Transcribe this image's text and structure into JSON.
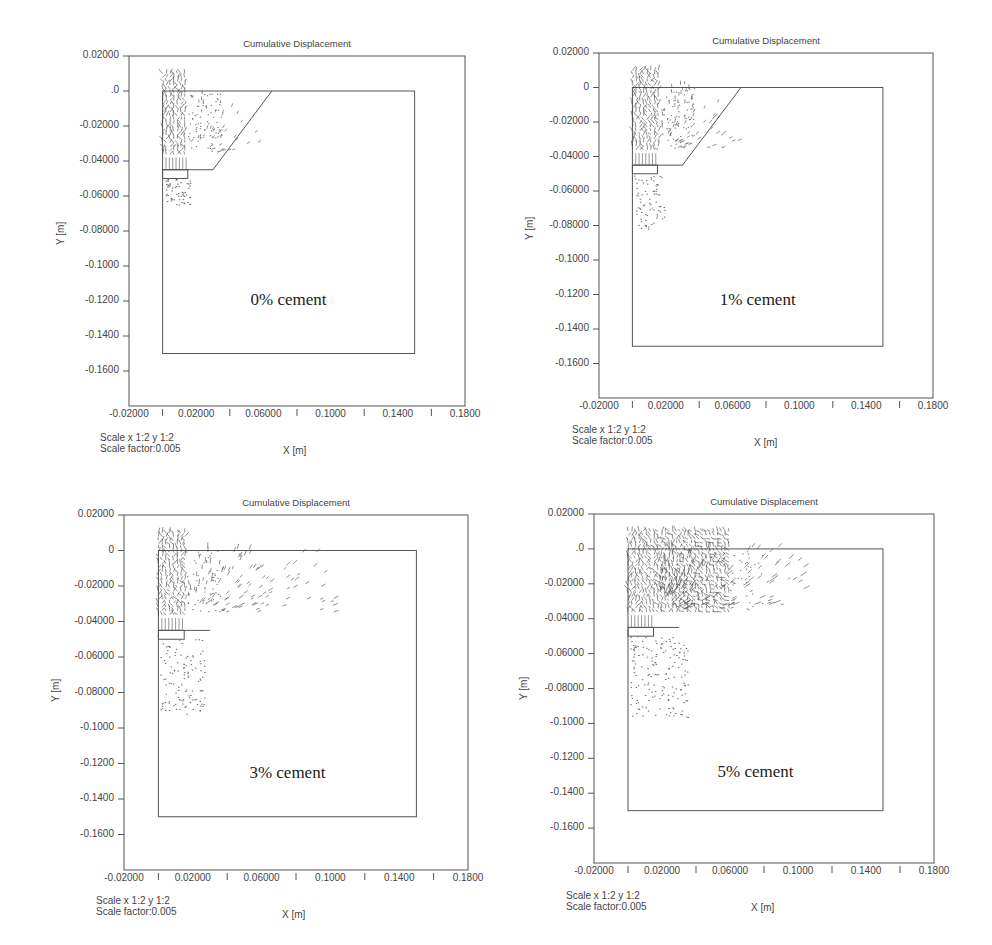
{
  "chart_data": [
    {
      "type": "vector-field",
      "title": "Cumulative Displacement",
      "annotation": "0% cement",
      "xlabel": "X [m]",
      "ylabel": "Y [m]",
      "scale_text": [
        "Scale x 1:2  y 1:2",
        "Scale factor:0.005"
      ],
      "xlim": [
        -0.02,
        0.18
      ],
      "ylim": [
        -0.18,
        0.02
      ],
      "x_ticks": [
        "-0.02000",
        "0.02000",
        "0.06000",
        "0.1000",
        "0.1400",
        "0.1800"
      ],
      "y_ticks": [
        "0.02000",
        ".0",
        "-0.02000",
        "-0.04000",
        "-0.06000",
        "-0.08000",
        "-0.1000",
        "-0.1200",
        "-0.1400",
        "-0.1600"
      ],
      "domain_box": {
        "x": [
          0.0,
          0.15
        ],
        "y": [
          -0.15,
          0.0
        ]
      },
      "slope_line": [
        [
          0.0,
          -0.045
        ],
        [
          0.03,
          -0.045
        ],
        [
          0.065,
          0.0
        ]
      ],
      "footing_box": {
        "x": [
          0.0,
          0.015
        ],
        "y": [
          -0.05,
          -0.045
        ]
      },
      "dense_zone": {
        "x": [
          0.0,
          0.015
        ],
        "y": [
          -0.038,
          0.01
        ]
      },
      "spread_extent": {
        "x": 0.04,
        "y": -0.065
      },
      "intensity": 0.15
    },
    {
      "type": "vector-field",
      "title": "Cumulative Displacement",
      "annotation": "1% cement",
      "xlabel": "X [m]",
      "ylabel": "Y [m]",
      "scale_text": [
        "Scale x 1:2  y 1:2",
        "Scale factor:0.005"
      ],
      "xlim": [
        -0.02,
        0.18
      ],
      "ylim": [
        -0.18,
        0.02
      ],
      "x_ticks": [
        "-0.02000",
        "0.02000",
        "0.06000",
        "0.1000",
        "0.1400",
        "0.1800"
      ],
      "y_ticks": [
        "0.02000",
        "0",
        "-0.02000",
        "-0.04000",
        "-0.06000",
        "-0.08000",
        "-0.1000",
        "-0.1200",
        "-0.1400",
        "-0.1600"
      ],
      "domain_box": {
        "x": [
          0.0,
          0.15
        ],
        "y": [
          -0.15,
          0.0
        ]
      },
      "slope_line": [
        [
          0.0,
          -0.045
        ],
        [
          0.03,
          -0.045
        ],
        [
          0.065,
          0.0
        ]
      ],
      "footing_box": {
        "x": [
          0.0,
          0.015
        ],
        "y": [
          -0.05,
          -0.045
        ]
      },
      "dense_zone": {
        "x": [
          0.0,
          0.017
        ],
        "y": [
          -0.038,
          0.01
        ]
      },
      "spread_extent": {
        "x": 0.045,
        "y": -0.082
      },
      "intensity": 0.25
    },
    {
      "type": "vector-field",
      "title": "Cumulative Displacement",
      "annotation": "3% cement",
      "xlabel": "X [m]",
      "ylabel": "Y [m]",
      "scale_text": [
        "Scale x 1:2  y 1:2",
        "Scale factor:0.005"
      ],
      "xlim": [
        -0.02,
        0.18
      ],
      "ylim": [
        -0.18,
        0.02
      ],
      "x_ticks": [
        "-0.02000",
        "0.02000",
        "0.06000",
        "0.1000",
        "0.1400",
        "0.1800"
      ],
      "y_ticks": [
        "0.02000",
        "0",
        "-0.02000",
        "-0.04000",
        "-0.06000",
        "-0.08000",
        "-0.1000",
        "-0.1200",
        "-0.1400",
        "-0.1600"
      ],
      "domain_box": {
        "x": [
          0.0,
          0.15
        ],
        "y": [
          -0.15,
          0.0
        ]
      },
      "slope_line": null,
      "footing_box": {
        "x": [
          0.0,
          0.015
        ],
        "y": [
          -0.05,
          -0.045
        ]
      },
      "dense_zone": {
        "x": [
          0.0,
          0.016
        ],
        "y": [
          -0.038,
          0.01
        ]
      },
      "spread_extent": {
        "x": 0.08,
        "y": -0.092
      },
      "intensity": 0.55
    },
    {
      "type": "vector-field",
      "title": "Cumulative Displacement",
      "annotation": "5% cement",
      "xlabel": "X [m]",
      "ylabel": "Y [m]",
      "scale_text": [
        "Scale x 1:2  y 1:2",
        "Scale factor:0.005"
      ],
      "xlim": [
        -0.02,
        0.18
      ],
      "ylim": [
        -0.18,
        0.02
      ],
      "x_ticks": [
        "-0.02000",
        "0.02000",
        "0.06000",
        "0.1000",
        "0.1400",
        "0.1800"
      ],
      "y_ticks": [
        "0.02000",
        ".0",
        "-0.02000",
        "-0.04000",
        "-0.06000",
        "-0.08000",
        "-0.1000",
        "-0.1200",
        "-0.1400",
        "-0.1600"
      ],
      "domain_box": {
        "x": [
          0.0,
          0.15
        ],
        "y": [
          -0.15,
          0.0
        ]
      },
      "slope_line": null,
      "footing_box": {
        "x": [
          0.0,
          0.015
        ],
        "y": [
          -0.05,
          -0.045
        ]
      },
      "dense_zone": {
        "x": [
          0.0,
          0.06
        ],
        "y": [
          -0.038,
          0.01
        ]
      },
      "spread_extent": {
        "x": 0.085,
        "y": -0.097
      },
      "intensity": 0.9
    }
  ],
  "panels": [
    {
      "left": 0,
      "top": 0,
      "frame": [
        129,
        56,
        465,
        406
      ],
      "title_y": 38,
      "xlab_x": 283,
      "xlab_y": 445,
      "scale_x": 100,
      "scale_y": 432,
      "ylab_x": 55,
      "ylab_y": 245,
      "annot_y": 290
    },
    {
      "left": 496,
      "top": 0,
      "frame": [
        103,
        53,
        437,
        398
      ],
      "title_y": 35,
      "xlab_x": 258,
      "xlab_y": 437,
      "scale_x": 76,
      "scale_y": 424,
      "ylab_x": 28,
      "ylab_y": 240,
      "annot_y": 290
    },
    {
      "left": 0,
      "top": 470,
      "frame": [
        124,
        45,
        468,
        400
      ],
      "title_y": 27,
      "xlab_x": 282,
      "xlab_y": 439,
      "scale_x": 96,
      "scale_y": 425,
      "ylab_x": 50,
      "ylab_y": 232,
      "annot_y": 293
    },
    {
      "left": 496,
      "top": 470,
      "frame": [
        98,
        44,
        438,
        393
      ],
      "title_y": 26,
      "xlab_x": 255,
      "xlab_y": 432,
      "scale_x": 70,
      "scale_y": 420,
      "ylab_x": 22,
      "ylab_y": 230,
      "annot_y": 292
    }
  ]
}
